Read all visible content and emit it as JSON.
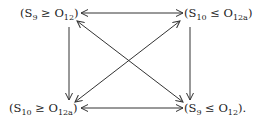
{
  "diagram": {
    "nodes": [
      {
        "id": "tl",
        "open": "(S",
        "s_sub": "9",
        "rel": " ≥ O",
        "o_sub": "12",
        "close": ")"
      },
      {
        "id": "tr",
        "open": "(S",
        "s_sub": "10",
        "rel": " ≤ O",
        "o_sub": "12a",
        "close": ")"
      },
      {
        "id": "bl",
        "open": "(S",
        "s_sub": "10",
        "rel": " ≥ O",
        "o_sub": "12a",
        "close": ")"
      },
      {
        "id": "br",
        "open": "(S",
        "s_sub": "9",
        "rel": " ≤ O",
        "o_sub": "12",
        "close": ")."
      }
    ],
    "edges": [
      {
        "from": "tl",
        "to": "tr",
        "type": "bidirectional"
      },
      {
        "from": "bl",
        "to": "br",
        "type": "bidirectional"
      },
      {
        "from": "tl",
        "to": "bl",
        "type": "directed"
      },
      {
        "from": "tr",
        "to": "br",
        "type": "directed"
      },
      {
        "from": "tl",
        "to": "br",
        "type": "bidirectional"
      },
      {
        "from": "tr",
        "to": "bl",
        "type": "bidirectional"
      }
    ],
    "stroke_color": "#333333"
  }
}
